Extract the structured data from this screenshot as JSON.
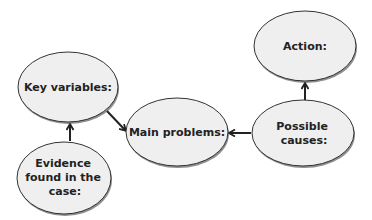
{
  "diagram": {
    "type": "concept-map",
    "colors": {
      "background": "#ffffff",
      "node_fill": "#efefef",
      "node_stroke": "#333333",
      "node_shadow": "#444444",
      "arrow": "#222222",
      "text": "#222222"
    },
    "nodes": [
      {
        "id": "key_variables",
        "lines": [
          "Key variables:"
        ]
      },
      {
        "id": "evidence",
        "lines": [
          "Evidence",
          "found in the",
          "case:"
        ]
      },
      {
        "id": "main_problems",
        "lines": [
          "Main problems:"
        ]
      },
      {
        "id": "possible_causes",
        "lines": [
          "Possible",
          "causes:"
        ]
      },
      {
        "id": "action",
        "lines": [
          "Action:"
        ]
      }
    ],
    "edges": [
      {
        "from": "evidence",
        "to": "key_variables"
      },
      {
        "from": "key_variables",
        "to": "main_problems"
      },
      {
        "from": "possible_causes",
        "to": "main_problems"
      },
      {
        "from": "possible_causes",
        "to": "action"
      }
    ]
  }
}
